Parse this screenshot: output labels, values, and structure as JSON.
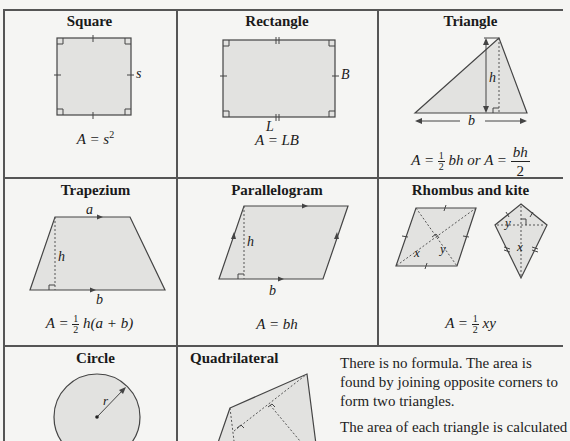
{
  "cells": {
    "square": {
      "title": "Square",
      "side_label": "s",
      "formula_lhs": "A = s",
      "formula_exp": "2"
    },
    "rectangle": {
      "title": "Rectangle",
      "length_label": "L",
      "breadth_label": "B",
      "formula": "A = LB"
    },
    "triangle": {
      "title": "Triangle",
      "height_label": "h",
      "base_label": "b",
      "formula_prefix": "A = ",
      "half_num": "1",
      "half_den": "2",
      "formula_mid": "bh or A = ",
      "frac_num": "bh",
      "frac_den": "2"
    },
    "trapezium": {
      "title": "Trapezium",
      "top_label": "a",
      "height_label": "h",
      "base_label": "b",
      "formula_prefix": "A = ",
      "half_num": "1",
      "half_den": "2",
      "formula_suffix": "h(a + b)"
    },
    "parallelogram": {
      "title": "Parallelogram",
      "height_label": "h",
      "base_label": "b",
      "formula": "A = bh"
    },
    "rhombus_kite": {
      "title": "Rhombus and kite",
      "x_label": "x",
      "y_label": "y",
      "formula_prefix": "A = ",
      "half_num": "1",
      "half_den": "2",
      "formula_suffix": "xy"
    },
    "circle": {
      "title": "Circle",
      "radius_label": "r"
    },
    "quadrilateral": {
      "title": "Quadrilateral",
      "paragraph1": "There is no formula. The area is found by joining opposite corners to form two triangles.",
      "paragraph2": "The area of each triangle is calculated"
    }
  },
  "colors": {
    "fill": "#e2e2e0",
    "stroke": "#444444",
    "grid": "#555555",
    "background": "#f5f5f3"
  }
}
